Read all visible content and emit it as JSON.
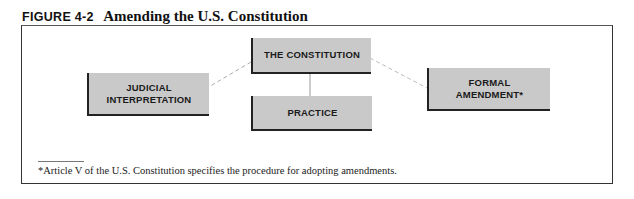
{
  "figure": {
    "label": "FIGURE 4-2",
    "title": "Amending the U.S. Constitution"
  },
  "nodes": {
    "constitution": "THE CONSTITUTION",
    "judicial": [
      "JUDICIAL",
      "INTERPRETATION"
    ],
    "practice": "PRACTICE",
    "formal": [
      "FORMAL",
      "AMENDMENT*"
    ]
  },
  "edges": [
    {
      "from": "constitution",
      "to": "judicial",
      "style": "dashed"
    },
    {
      "from": "constitution",
      "to": "practice",
      "style": "solid"
    },
    {
      "from": "constitution",
      "to": "formal",
      "style": "dashed"
    }
  ],
  "footnote": "*Article V of the U.S. Constitution specifies the procedure for adopting amendments.",
  "colors": {
    "box_fill": "#c9c9c9",
    "box_shadow": "#222222"
  }
}
